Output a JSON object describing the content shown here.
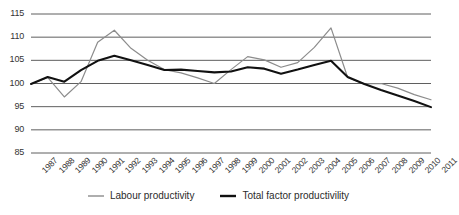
{
  "chart_data": {
    "type": "line",
    "title": "",
    "xlabel": "",
    "ylabel": "",
    "ylim": [
      85,
      115
    ],
    "yticks": [
      85,
      90,
      95,
      100,
      105,
      110,
      115
    ],
    "grid": true,
    "legend_position": "bottom-center",
    "categories": [
      "1987",
      "1988",
      "1989",
      "1990",
      "1991",
      "1992",
      "1993",
      "1994",
      "1995",
      "1996",
      "1997",
      "1998",
      "1999",
      "2000",
      "2001",
      "2002",
      "2003",
      "2004",
      "2005",
      "2006",
      "2007",
      "2008",
      "2009",
      "2010",
      "2011"
    ],
    "series": [
      {
        "name": "Labour productivity",
        "color": "#8c8c8c",
        "values": [
          99.9,
          101.3,
          97.1,
          100.4,
          108.9,
          111.5,
          107.6,
          105.0,
          103.0,
          102.3,
          101.2,
          100.0,
          103.0,
          105.8,
          105.1,
          103.5,
          104.5,
          107.8,
          112.0,
          101.3,
          99.9,
          100.0,
          99.0,
          97.6,
          96.5
        ]
      },
      {
        "name": "Total factor productivility",
        "color": "#111111",
        "values": [
          99.9,
          101.4,
          100.4,
          102.9,
          104.9,
          106.0,
          105.0,
          104.0,
          102.9,
          103.0,
          102.7,
          102.4,
          102.6,
          103.5,
          103.2,
          102.1,
          103.0,
          104.0,
          104.9,
          101.4,
          99.9,
          98.6,
          97.4,
          96.2,
          94.9
        ]
      }
    ]
  },
  "axes": {
    "y_tick_labels": [
      "115",
      "110",
      "105",
      "100",
      "95",
      "90",
      "85"
    ],
    "x_tick_labels": [
      "1987",
      "1988",
      "1989",
      "1990",
      "1991",
      "1992",
      "1993",
      "1994",
      "1995",
      "1996",
      "1997",
      "1998",
      "1999",
      "2000",
      "2001",
      "2002",
      "2003",
      "2004",
      "2005",
      "2006",
      "2007",
      "2008",
      "2009",
      "2010",
      "2011"
    ]
  },
  "legend": {
    "items": [
      {
        "label": "Labour productivity",
        "color": "#8c8c8c"
      },
      {
        "label": "Total factor productivility",
        "color": "#111111"
      }
    ]
  },
  "colors": {
    "gridline": "#4d4d4d",
    "labour": "#8c8c8c",
    "tfp": "#111111",
    "text": "#333333",
    "background": "#ffffff"
  }
}
